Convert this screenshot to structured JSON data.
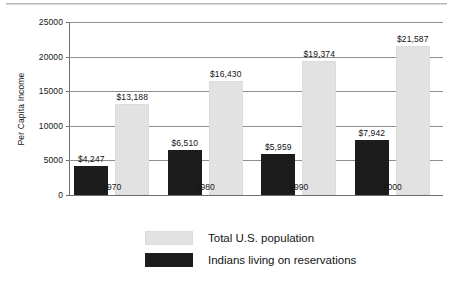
{
  "chart_data": {
    "type": "bar",
    "title": "",
    "subtitle": "",
    "xlabel": "",
    "ylabel": "Per Capita Income",
    "categories": [
      "1970",
      "1980",
      "1990",
      "2000"
    ],
    "ylim": [
      0,
      25000
    ],
    "ytick_values": [
      0,
      5000,
      10000,
      15000,
      20000,
      25000
    ],
    "ytick_labels": [
      "0",
      "5000",
      "10000",
      "15000",
      "20000",
      "25000"
    ],
    "grid": true,
    "legend_position": "bottom",
    "series": [
      {
        "name": "Total U.S. population",
        "color": "#e2e2e2",
        "values": [
          13188,
          16430,
          19374,
          21587
        ],
        "labels": [
          "$13,188",
          "$16,430",
          "$19,374",
          "$21,587"
        ]
      },
      {
        "name": "Indians living on reservations",
        "color": "#1c1c1c",
        "values": [
          4247,
          6510,
          5959,
          7942
        ],
        "labels": [
          "$4,247",
          "$6,510",
          "$5,959",
          "$7,942"
        ]
      }
    ]
  },
  "legend": {
    "items": [
      {
        "label": "Total U.S. population",
        "swatch": "light-gray-swatch"
      },
      {
        "label": "Indians living on reservations",
        "swatch": "black-swatch"
      }
    ]
  },
  "colors": {
    "series_light": "#e2e2e2",
    "series_dark": "#1c1c1c",
    "gridline": "#8e8e8e",
    "axis": "#6f6f6f",
    "text": "#161616",
    "background": "#ffffff"
  }
}
